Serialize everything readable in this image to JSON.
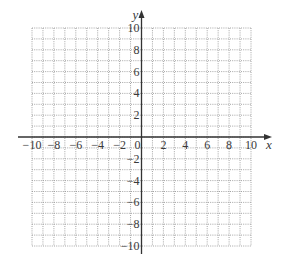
{
  "figure": {
    "type": "coordinate-plane",
    "x_axis": {
      "name": "x",
      "min": -10,
      "max": 10,
      "tick_labels": [
        "-10",
        "-8",
        "-6",
        "-4",
        "-2",
        "0",
        "2",
        "4",
        "6",
        "8",
        "10"
      ]
    },
    "y_axis": {
      "name": "y",
      "min": -10,
      "max": 10,
      "tick_labels": [
        "10",
        "8",
        "6",
        "4",
        "2",
        "-2",
        "-4",
        "-6",
        "-8",
        "-10"
      ]
    },
    "grid": {
      "step": 1,
      "style": "dotted",
      "cells_x": 20,
      "cells_y": 20
    },
    "colors": {
      "grid": "#9a9a9a",
      "axis": "#333333",
      "text": "#3a3a3a",
      "background": "#ffffff"
    }
  },
  "chart_data": {
    "type": "scatter",
    "title": "",
    "xlabel": "x",
    "ylabel": "y",
    "xlim": [
      -10,
      10
    ],
    "ylim": [
      -10,
      10
    ],
    "grid": true,
    "x_ticks": [
      -10,
      -8,
      -6,
      -4,
      -2,
      0,
      2,
      4,
      6,
      8,
      10
    ],
    "y_ticks": [
      -10,
      -8,
      -6,
      -4,
      -2,
      2,
      4,
      6,
      8,
      10
    ],
    "series": []
  }
}
